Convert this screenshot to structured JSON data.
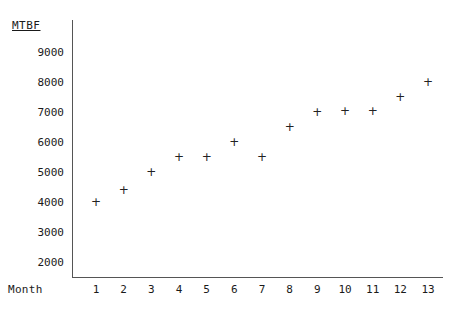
{
  "chart_data": {
    "type": "scatter",
    "title": "",
    "xlabel": "Month",
    "ylabel": "MTBF",
    "x": [
      1,
      2,
      3,
      4,
      5,
      6,
      7,
      8,
      9,
      10,
      11,
      12,
      13
    ],
    "values": [
      4000,
      4400,
      5000,
      5500,
      5500,
      6000,
      5500,
      6500,
      7000,
      7050,
      7050,
      7500,
      8000
    ],
    "series": [
      {
        "name": "MTBF",
        "values": [
          4000,
          4400,
          5000,
          5500,
          5500,
          6000,
          5500,
          6500,
          7000,
          7050,
          7050,
          7500,
          8000
        ]
      }
    ],
    "xtick_labels": [
      "1",
      "2",
      "3",
      "4",
      "5",
      "6",
      "7",
      "8",
      "9",
      "10",
      "11",
      "12",
      "13"
    ],
    "ytick_labels": [
      "9000",
      "8000",
      "7000",
      "6000",
      "5000",
      "4000",
      "3000",
      "2000"
    ],
    "ytick_values": [
      9000,
      8000,
      7000,
      6000,
      5000,
      4000,
      3000,
      2000
    ],
    "ylim": [
      1500,
      9500
    ],
    "xlim": [
      0.4,
      13.6
    ],
    "grid": false,
    "legend": false,
    "marker": "+",
    "marker_color": "#222222",
    "axis_color": "#555555"
  },
  "axes": {
    "y_title": "MTBF",
    "x_title": "Month"
  }
}
